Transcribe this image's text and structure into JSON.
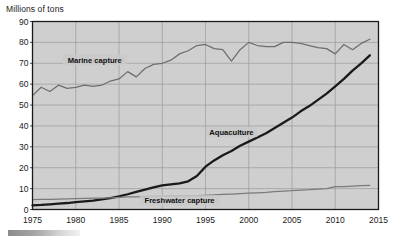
{
  "chart_data": {
    "type": "line",
    "title": "",
    "ylabel": "Millions of tons",
    "xlabel": "",
    "ylim": [
      0,
      90
    ],
    "xlim": [
      1975,
      2015
    ],
    "grid": true,
    "legend_position": "inline-annotations",
    "y_ticks": [
      0,
      10,
      20,
      30,
      40,
      50,
      60,
      70,
      80,
      90
    ],
    "x_ticks": [
      1975,
      1980,
      1985,
      1990,
      1995,
      2000,
      2005,
      2010,
      2015
    ],
    "x": [
      1975,
      1976,
      1977,
      1978,
      1979,
      1980,
      1981,
      1982,
      1983,
      1984,
      1985,
      1986,
      1987,
      1988,
      1989,
      1990,
      1991,
      1992,
      1993,
      1994,
      1995,
      1996,
      1997,
      1998,
      1999,
      2000,
      2001,
      2002,
      2003,
      2004,
      2005,
      2006,
      2007,
      2008,
      2009,
      2010,
      2011,
      2012,
      2013,
      2014
    ],
    "series": [
      {
        "name": "Marine capture",
        "color": "#6e6e6e",
        "label_x": 1982.2,
        "label_y": 71.5,
        "values": [
          54.5,
          58.5,
          56.5,
          59.5,
          58.0,
          58.5,
          59.5,
          59.0,
          59.5,
          61.5,
          62.5,
          66.0,
          63.5,
          67.5,
          69.5,
          70.0,
          71.5,
          74.5,
          76.0,
          78.5,
          79.0,
          77.0,
          76.5,
          71.0,
          76.5,
          80.0,
          78.5,
          78.0,
          78.0,
          80.0,
          80.0,
          79.5,
          78.5,
          77.5,
          77.0,
          74.5,
          79.0,
          76.5,
          79.5,
          81.5
        ]
      },
      {
        "name": "Aquaculture",
        "color": "#1a1a1a",
        "label_x": 1998.0,
        "label_y": 37.0,
        "values": [
          2.0,
          2.2,
          2.5,
          2.8,
          3.1,
          3.5,
          3.9,
          4.3,
          4.8,
          5.5,
          6.3,
          7.3,
          8.4,
          9.5,
          10.6,
          11.5,
          12.0,
          12.5,
          13.5,
          16.0,
          20.5,
          23.5,
          26.0,
          28.0,
          30.5,
          32.5,
          34.5,
          36.5,
          39.0,
          41.5,
          44.0,
          47.0,
          49.5,
          52.5,
          55.5,
          59.0,
          62.5,
          66.5,
          70.0,
          73.8
        ]
      },
      {
        "name": "Freshwater capture",
        "color": "#7a7a7a",
        "label_x": 1992.0,
        "label_y": 4.2,
        "values": [
          4.7,
          4.8,
          4.9,
          5.0,
          5.1,
          5.2,
          5.3,
          5.4,
          5.5,
          5.6,
          5.8,
          6.0,
          6.1,
          6.2,
          6.3,
          6.4,
          6.5,
          6.4,
          6.5,
          6.6,
          6.8,
          7.0,
          7.2,
          7.4,
          7.6,
          7.8,
          8.0,
          8.2,
          8.5,
          8.8,
          9.0,
          9.3,
          9.5,
          9.8,
          10.0,
          10.9,
          11.0,
          11.2,
          11.4,
          11.6
        ]
      }
    ]
  }
}
